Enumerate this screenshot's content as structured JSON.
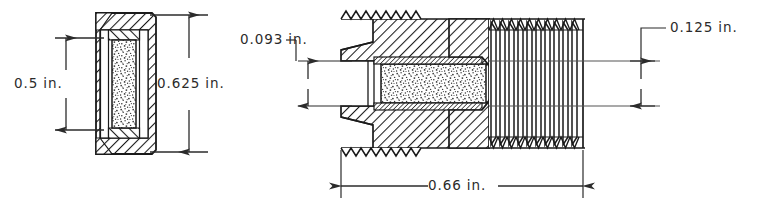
{
  "drawing": {
    "title": "Sectioned assembly drawing of threaded porous-element fitting",
    "background_color": "#ffffff",
    "line_color": "#1a1a1a",
    "dimension_line_color": "#2b2b2b",
    "hatch_color": "#1a1a1a",
    "stipple_color": "#3a3a3a",
    "units": "in.",
    "views": [
      {
        "name": "left-end-view",
        "description": "Sectioned end view of retaining cap with porous element"
      },
      {
        "name": "right-side-view",
        "description": "Sectioned side view of externally threaded body with internal porous element"
      }
    ]
  },
  "dimensions": [
    {
      "id": "left-inner-height",
      "label": "0.5 in.",
      "value": 0.5,
      "unit": "in.",
      "orientation": "vertical",
      "view": "left-end-view",
      "side": "left"
    },
    {
      "id": "left-outer-height",
      "label": "0.625 in.",
      "value": 0.625,
      "unit": "in.",
      "orientation": "vertical",
      "view": "left-end-view",
      "side": "right"
    },
    {
      "id": "bore-diameter",
      "label": "0.093 in.",
      "value": 0.093,
      "unit": "in.",
      "orientation": "vertical",
      "view": "right-side-view",
      "side": "left",
      "has_leader": true
    },
    {
      "id": "thread-minor-dimension",
      "label": "0.125 in.",
      "value": 0.125,
      "unit": "in.",
      "orientation": "vertical",
      "view": "right-side-view",
      "side": "right",
      "has_leader": true
    },
    {
      "id": "overall-length",
      "label": "0.66 in.",
      "value": 0.66,
      "unit": "in.",
      "orientation": "horizontal",
      "view": "right-side-view",
      "side": "bottom"
    }
  ]
}
